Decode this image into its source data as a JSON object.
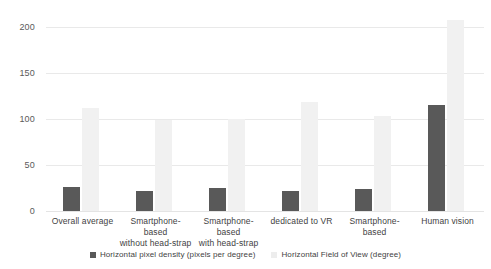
{
  "chart_data": {
    "type": "bar",
    "title": "",
    "subtitle": "",
    "xlabel": "",
    "ylabel": "",
    "ylim": [
      0,
      220
    ],
    "yticks": [
      0,
      50,
      100,
      150,
      200
    ],
    "ytick_labels": [
      "0",
      "50",
      "100",
      "150",
      "200"
    ],
    "grid": true,
    "legend_position": "bottom",
    "categories": [
      "Overall average",
      "Smartphone-based without head-strap",
      "Smartphone-based with head-strap",
      "dedicated to VR",
      "Smartphone-based",
      "Human vision"
    ],
    "category_lines": [
      [
        "Overall average"
      ],
      [
        "Smartphone-based",
        "without head-strap"
      ],
      [
        "Smartphone-based",
        "with head-strap"
      ],
      [
        "dedicated to VR"
      ],
      [
        "Smartphone-based"
      ],
      [
        "Human vision"
      ]
    ],
    "series": [
      {
        "name": "Horizontal pixel density (pixels per degree)",
        "color": "#595959",
        "values": [
          26,
          22,
          25,
          22,
          24,
          115
        ]
      },
      {
        "name": "Horizontal Field of View (degree)",
        "color": "#f1f1f1",
        "values": [
          112,
          99,
          100,
          118,
          103,
          208
        ]
      }
    ]
  },
  "legend": {
    "items": [
      {
        "label": "Horizontal pixel density (pixels per degree)",
        "swatch": "density"
      },
      {
        "label": "Horizontal Field of View (degree)",
        "swatch": "fov"
      }
    ]
  },
  "colors": {
    "series_density": "#595959",
    "series_fov": "#f1f1f1",
    "gridline": "#e9e9e9",
    "text": "#3f3f3f",
    "background": "#ffffff"
  }
}
